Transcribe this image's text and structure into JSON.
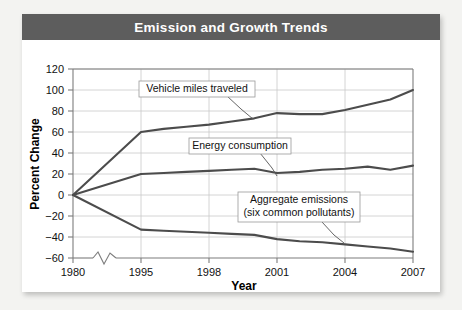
{
  "figure": {
    "title": "Emission and Growth Trends"
  },
  "chart_data": {
    "type": "line",
    "title": "Emission and Growth Trends",
    "xlabel": "Year",
    "ylabel": "Percent Change",
    "xlim": [
      1980,
      2007
    ],
    "ylim": [
      -60,
      120
    ],
    "ytick_step": 20,
    "grid": "horizontal-and-vertical",
    "legend": "inline-annotations",
    "axis_break": {
      "present": true,
      "between": [
        1980,
        1995
      ],
      "note": "zigzag break on x-axis"
    },
    "xticks": [
      "1980",
      "1995",
      "1998",
      "2001",
      "2004",
      "2007"
    ],
    "yticks": [
      "120",
      "100",
      "80",
      "60",
      "40",
      "20",
      "0",
      "−20",
      "−40",
      "−60"
    ],
    "x": [
      1980,
      1995,
      1996,
      1997,
      1998,
      1999,
      2000,
      2001,
      2002,
      2003,
      2004,
      2005,
      2006,
      2007
    ],
    "series": [
      {
        "name": "Vehicle miles traveled",
        "values": [
          0,
          60,
          63,
          65,
          67,
          70,
          73,
          78,
          77,
          77,
          81,
          86,
          91,
          100
        ]
      },
      {
        "name": "Energy consumption",
        "values": [
          0,
          20,
          21,
          22,
          23,
          24,
          25,
          21,
          22,
          24,
          25,
          27,
          24,
          28
        ]
      },
      {
        "name": "Aggregate emissions (six common pollutants)",
        "values": [
          0,
          -33,
          -34,
          -35,
          -36,
          -37,
          -38,
          -42,
          -44,
          -45,
          -47,
          -49,
          -51,
          -54
        ]
      }
    ],
    "annotations": [
      {
        "id": "vehicle-miles-traveled",
        "text": "Vehicle miles traveled",
        "lines": [
          "Vehicle miles traveled"
        ]
      },
      {
        "id": "energy-consumption",
        "text": "Energy consumption",
        "lines": [
          "Energy consumption"
        ]
      },
      {
        "id": "aggregate-emissions",
        "text": "Aggregate emissions (six common pollutants)",
        "lines": [
          "Aggregate emissions",
          "(six common pollutants)"
        ]
      }
    ],
    "colors": {
      "title_bar": "#5d5d5d",
      "title_text": "#ffffff",
      "line": "#4c4c4c",
      "grid": "#c9c9c9",
      "frame": "#7d7d7d",
      "card": "#ffffff"
    }
  },
  "yaxis": {
    "title": "Percent Change",
    "ticks": [
      {
        "label": "120"
      },
      {
        "label": "100"
      },
      {
        "label": "80"
      },
      {
        "label": "60"
      },
      {
        "label": "40"
      },
      {
        "label": "20"
      },
      {
        "label": "0"
      },
      {
        "label": "−20"
      },
      {
        "label": "−40"
      },
      {
        "label": "−60"
      }
    ]
  },
  "xaxis": {
    "title": "Year",
    "ticks": [
      {
        "label": "1980"
      },
      {
        "label": "1995"
      },
      {
        "label": "1998"
      },
      {
        "label": "2001"
      },
      {
        "label": "2004"
      },
      {
        "label": "2007"
      }
    ]
  },
  "annotations": {
    "vmt": {
      "line1": "Vehicle miles traveled"
    },
    "energy": {
      "line1": "Energy consumption"
    },
    "emissions": {
      "line1": "Aggregate emissions",
      "line2": "(six common pollutants)"
    }
  }
}
